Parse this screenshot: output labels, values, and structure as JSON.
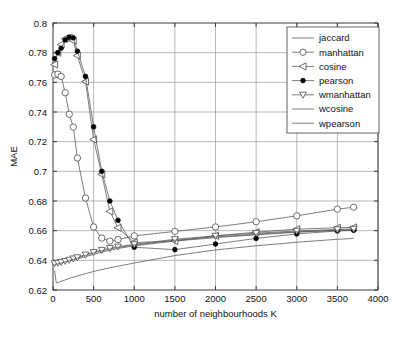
{
  "chart_data": {
    "type": "line",
    "title": "",
    "xlabel": "number of neighbourhoods K",
    "ylabel": "MAE",
    "xlim": [
      0,
      4000
    ],
    "ylim": [
      0.62,
      0.8
    ],
    "xticks": [
      0,
      500,
      1000,
      1500,
      2000,
      2500,
      3000,
      3500,
      4000
    ],
    "xtick_labels": [
      "0",
      "500",
      "1000",
      "1500",
      "2000",
      "2500",
      "3000",
      "3500",
      "4000"
    ],
    "yticks": [
      0.62,
      0.64,
      0.66,
      0.68,
      0.7,
      0.72,
      0.74,
      0.76,
      0.78,
      0.8
    ],
    "ytick_labels": [
      "0.62",
      "0.64",
      "0.66",
      "0.68",
      "0.7",
      "0.72",
      "0.74",
      "0.76",
      "0.78",
      "0.8"
    ],
    "grid": true,
    "legend_position": "upper-right",
    "series": [
      {
        "name": "jaccard",
        "marker": "none",
        "x": [
          20,
          60,
          100,
          150,
          200,
          250,
          300,
          400,
          500,
          600,
          700,
          800,
          1000,
          1500,
          2000,
          2500,
          3000,
          3500,
          3700
        ],
        "y": [
          0.6375,
          0.6378,
          0.6382,
          0.6388,
          0.6395,
          0.6402,
          0.641,
          0.6425,
          0.644,
          0.6455,
          0.6468,
          0.648,
          0.6498,
          0.653,
          0.6553,
          0.6572,
          0.659,
          0.6601,
          0.6605
        ]
      },
      {
        "name": "manhattan",
        "marker": "circle-open",
        "x": [
          20,
          60,
          100,
          150,
          200,
          250,
          300,
          400,
          500,
          600,
          700,
          800,
          1000,
          1500,
          2000,
          2500,
          3000,
          3500,
          3700
        ],
        "y": [
          0.765,
          0.7655,
          0.764,
          0.753,
          0.7385,
          0.7298,
          0.709,
          0.682,
          0.6625,
          0.655,
          0.653,
          0.654,
          0.6565,
          0.6595,
          0.6625,
          0.666,
          0.67,
          0.6745,
          0.6758
        ]
      },
      {
        "name": "cosine",
        "marker": "triangle-left-open",
        "x": [
          20,
          60,
          100,
          150,
          200,
          250,
          300,
          400,
          500,
          600,
          700,
          800,
          1000,
          1500,
          2000,
          2500,
          3000,
          3500,
          3700
        ],
        "y": [
          0.772,
          0.78,
          0.7855,
          0.7895,
          0.79,
          0.788,
          0.778,
          0.7605,
          0.7215,
          0.698,
          0.673,
          0.662,
          0.652,
          0.653,
          0.6565,
          0.659,
          0.661,
          0.662,
          0.6622
        ]
      },
      {
        "name": "pearson",
        "marker": "dot-filled",
        "x": [
          20,
          60,
          100,
          150,
          200,
          250,
          300,
          400,
          500,
          600,
          700,
          800,
          1000,
          1500,
          2000,
          2500,
          3000,
          3500,
          3700
        ],
        "y": [
          0.776,
          0.78,
          0.783,
          0.7885,
          0.7905,
          0.79,
          0.781,
          0.764,
          0.73,
          0.7,
          0.68,
          0.667,
          0.6488,
          0.6472,
          0.651,
          0.6548,
          0.6578,
          0.6598,
          0.6602
        ]
      },
      {
        "name": "wmanhattan",
        "marker": "triangle-down-open",
        "x": [
          20,
          60,
          100,
          150,
          200,
          250,
          300,
          400,
          500,
          600,
          700,
          800,
          1000,
          1500,
          2000,
          2500,
          3000,
          3500,
          3700
        ],
        "y": [
          0.638,
          0.6383,
          0.6388,
          0.6395,
          0.6403,
          0.6412,
          0.642,
          0.6438,
          0.6455,
          0.647,
          0.6482,
          0.6492,
          0.6508,
          0.6542,
          0.6565,
          0.6583,
          0.6598,
          0.6608,
          0.6612
        ]
      },
      {
        "name": "wcosine",
        "marker": "none",
        "x": [
          20,
          60,
          100,
          150,
          200,
          250,
          300,
          400,
          500,
          600,
          700,
          800,
          1000,
          1500,
          2000,
          2500,
          3000,
          3500,
          3700
        ],
        "y": [
          0.6372,
          0.6376,
          0.6381,
          0.639,
          0.6398,
          0.6407,
          0.6416,
          0.6433,
          0.645,
          0.6464,
          0.6476,
          0.6487,
          0.6503,
          0.6536,
          0.6558,
          0.6576,
          0.6592,
          0.6603,
          0.6607
        ]
      },
      {
        "name": "wpearson",
        "marker": "none",
        "x": [
          20,
          40,
          60,
          100,
          150,
          200,
          300,
          400,
          500,
          700,
          1000,
          1500,
          2000,
          2500,
          3000,
          3500,
          3700
        ],
        "y": [
          0.633,
          0.6248,
          0.625,
          0.6258,
          0.6268,
          0.6278,
          0.6295,
          0.631,
          0.6325,
          0.635,
          0.6382,
          0.6432,
          0.647,
          0.6498,
          0.6522,
          0.6542,
          0.6548
        ]
      }
    ]
  },
  "legend": {
    "items": [
      {
        "label": "jaccard"
      },
      {
        "label": "manhattan"
      },
      {
        "label": "cosine"
      },
      {
        "label": "pearson"
      },
      {
        "label": "wmanhattan"
      },
      {
        "label": "wcosine"
      },
      {
        "label": "wpearson"
      }
    ]
  }
}
